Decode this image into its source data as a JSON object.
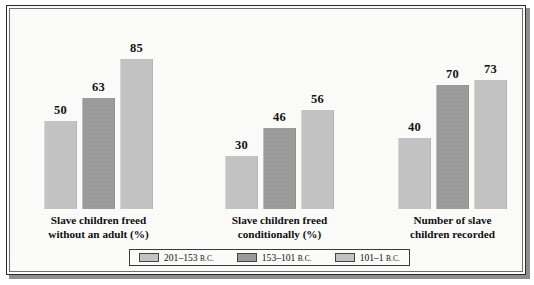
{
  "chart_data": {
    "type": "bar",
    "title": "",
    "xlabel": "",
    "ylabel": "",
    "grid": false,
    "legend_position": "bottom",
    "ylim": [
      0,
      95
    ],
    "categories": [
      "Slave children freed\nwithout an adult (%)",
      "Slave children freed\nconditionally (%)",
      "Number of slave\nchildren recorded"
    ],
    "category_lines": [
      [
        "Slave children freed",
        "without an adult (%)"
      ],
      [
        "Slave children freed",
        "conditionally (%)"
      ],
      [
        "Number of slave",
        "children recorded"
      ]
    ],
    "series": [
      {
        "name": "201–153 B.C.",
        "name_main": "201–153",
        "name_era": "B.C.",
        "color": "#c3c3c3",
        "values": [
          50,
          30,
          40
        ]
      },
      {
        "name": "153–101 B.C.",
        "name_main": "153–101",
        "name_era": "B.C.",
        "color": "#9b9b9b",
        "values": [
          63,
          46,
          70
        ]
      },
      {
        "name": "101–1 B.C.",
        "name_main": "101–1",
        "name_era": "B.C.",
        "color": "#c3c3c3",
        "values": [
          85,
          56,
          73
        ]
      }
    ],
    "value_labels": [
      [
        "50",
        "63",
        "85"
      ],
      [
        "30",
        "46",
        "56"
      ],
      [
        "40",
        "70",
        "73"
      ]
    ]
  },
  "colors": {
    "bar_light": "#c3c3c3",
    "bar_dark": "#9b9b9b",
    "bar_edge": "#b0b0b0",
    "frame_border": "#2a2a2a",
    "background": "#fbfbfa",
    "text": "#111111"
  }
}
